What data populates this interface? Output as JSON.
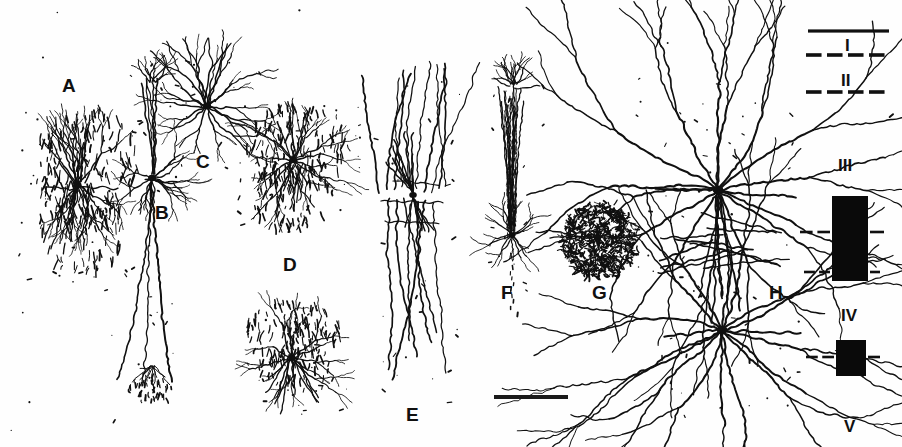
{
  "figure": {
    "type": "scientific-illustration",
    "background_color": "#fefefe",
    "ink_color": "#101010",
    "width": 902,
    "height": 447
  },
  "panels": [
    {
      "id": "A",
      "label": "A",
      "x": 62,
      "y": 76,
      "cell_type": "spiny-stellate-with-dense-punctate-field",
      "cx": 72,
      "cy": 185
    },
    {
      "id": "B",
      "label": "B",
      "x": 155,
      "y": 203,
      "cell_type": "pyramidal-with-long-descending-axon",
      "cx": 152,
      "cy": 170
    },
    {
      "id": "C",
      "label": "C",
      "x": 196,
      "y": 152,
      "cell_type": "multipolar-stellate",
      "cx": 205,
      "cy": 105
    },
    {
      "id": "D",
      "label": "D",
      "x": 283,
      "y": 255,
      "cell_type": "stellate-with-punctate-axonal-cloud",
      "cx": 290,
      "cy": 160
    },
    {
      "id": "D2",
      "label": "",
      "x": 0,
      "y": 0,
      "cell_type": "stellate-with-punctate-axonal-cloud-lower",
      "cx": 290,
      "cy": 355
    },
    {
      "id": "E",
      "label": "E",
      "x": 406,
      "y": 405,
      "cell_type": "bitufted-long-vertical-dendrites",
      "cx": 412,
      "cy": 195
    },
    {
      "id": "F",
      "label": "F",
      "x": 501,
      "y": 283,
      "cell_type": "double-bouquet-vertical-bundle",
      "cx": 511,
      "cy": 235
    },
    {
      "id": "G",
      "label": "G",
      "x": 592,
      "y": 283,
      "cell_type": "dense-spherical-axonal-plexus",
      "cx": 597,
      "cy": 240
    },
    {
      "id": "H",
      "label": "H",
      "x": 769,
      "y": 283,
      "cell_type": "two-large-multipolar-neurons",
      "cx": 718,
      "cy": 190
    }
  ],
  "layer_key": {
    "name": "cortical-layer-key",
    "labels": [
      {
        "numeral": "I",
        "x": 845,
        "y": 37
      },
      {
        "numeral": "II",
        "x": 841,
        "y": 72
      },
      {
        "numeral": "III",
        "x": 838,
        "y": 157
      },
      {
        "numeral": "IV",
        "x": 841,
        "y": 307
      },
      {
        "numeral": "V",
        "x": 844,
        "y": 418
      }
    ],
    "boundaries": [
      {
        "style": "solid",
        "y": 31,
        "x1": 808,
        "x2": 889
      },
      {
        "style": "dashed",
        "y": 55,
        "x1": 806,
        "x2": 890
      },
      {
        "style": "dashed",
        "y": 92,
        "x1": 806,
        "x2": 890
      }
    ],
    "bars": [
      {
        "name": "layer-III-bar",
        "x": 832,
        "y": 196,
        "width": 36,
        "height": 85,
        "color": "#0a0a0a"
      },
      {
        "name": "layer-IV-bar",
        "x": 836,
        "y": 340,
        "width": 30,
        "height": 36,
        "color": "#0a0a0a"
      }
    ],
    "tick_marks": [
      {
        "y": 232,
        "x1": 800,
        "x2": 830
      },
      {
        "y": 232,
        "x1": 870,
        "x2": 884
      },
      {
        "y": 272,
        "x1": 804,
        "x2": 830
      },
      {
        "y": 272,
        "x1": 870,
        "x2": 880
      },
      {
        "y": 357,
        "x1": 806,
        "x2": 834
      },
      {
        "y": 357,
        "x1": 868,
        "x2": 880
      }
    ]
  },
  "scale_bar": {
    "name": "scale-bar",
    "x": 494,
    "y": 395,
    "width": 74,
    "height": 4,
    "color": "#1a1a1a"
  }
}
